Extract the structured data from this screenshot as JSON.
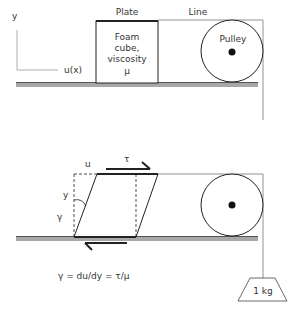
{
  "top_panel": {
    "axis_y_label": "y",
    "axis_x_label": "u(x)",
    "plate_label": "Plate",
    "line_label": "Line",
    "cube_label_lines": [
      "Foam",
      "cube,",
      "viscosity",
      "μ"
    ],
    "pulley_label": "Pulley"
  },
  "bottom_panel": {
    "u_label": "u",
    "tau_label": "τ",
    "y_label": "y",
    "gamma_label": "γ",
    "equation": "γ = du/dy = τ/μ",
    "weight_label": "1 kg"
  },
  "colors": {
    "line": "#222222",
    "ground": "#9e9e9e",
    "ground_edge": "#555555",
    "thin_line": "#777777"
  }
}
